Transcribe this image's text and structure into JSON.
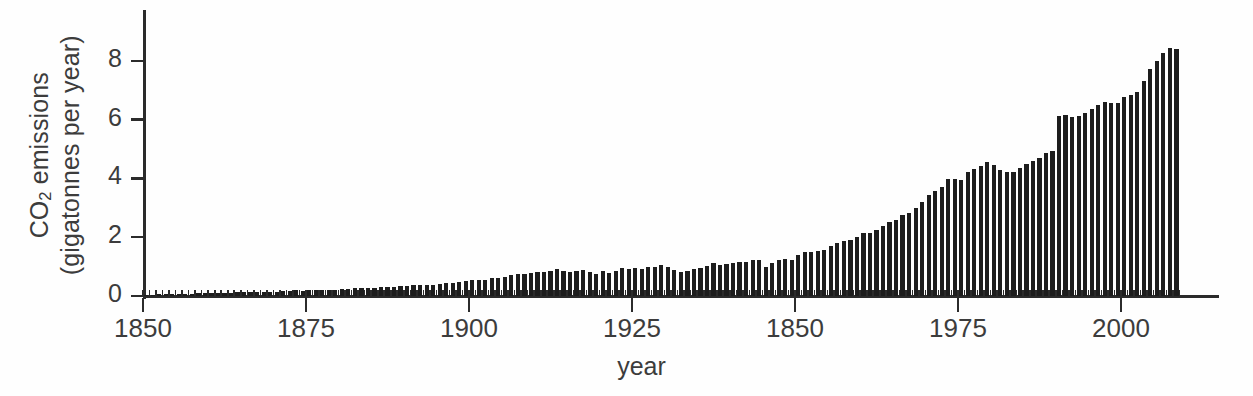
{
  "figure": {
    "background_color": "#fefefe",
    "ink_color": "#1d1d1d",
    "axis_color": "#2b2b2b",
    "text_color": "#3c3c3c"
  },
  "axes": {
    "y_title_line1_pre": "CO",
    "y_title_line1_sub": "2",
    "y_title_line1_post": " emissions",
    "y_title_line2": "(gigatonnes per year)",
    "x_title": "year",
    "y_ticks": [
      "0",
      "2",
      "4",
      "6",
      "8"
    ],
    "x_ticks": [
      "1850",
      "1875",
      "1900",
      "1925",
      "1850",
      "1975",
      "2000"
    ]
  },
  "chart_data": {
    "type": "bar",
    "title": "",
    "xlabel": "year",
    "ylabel": "CO2 emissions (gigatonnes per year)",
    "xlim": [
      1850,
      2008
    ],
    "ylim": [
      0,
      8.6
    ],
    "ytick_values": [
      0,
      2,
      4,
      6,
      8
    ],
    "xtick_values": [
      1850,
      1875,
      1900,
      1925,
      1950,
      1975,
      2000
    ],
    "xtick_labels": [
      "1850",
      "1875",
      "1900",
      "1925",
      "1850",
      "1975",
      "2000"
    ],
    "xtick_label_note": "Fifth tick is printed as 1850 in the original figure; positionally it is 1950.",
    "minor_tick_interval": 1,
    "grid": false,
    "legend": null,
    "units": "gigatonnes CO2 per year",
    "x": [
      1850,
      1851,
      1852,
      1853,
      1854,
      1855,
      1856,
      1857,
      1858,
      1859,
      1860,
      1861,
      1862,
      1863,
      1864,
      1865,
      1866,
      1867,
      1868,
      1869,
      1870,
      1871,
      1872,
      1873,
      1874,
      1875,
      1876,
      1877,
      1878,
      1879,
      1880,
      1881,
      1882,
      1883,
      1884,
      1885,
      1886,
      1887,
      1888,
      1889,
      1890,
      1891,
      1892,
      1893,
      1894,
      1895,
      1896,
      1897,
      1898,
      1899,
      1900,
      1901,
      1902,
      1903,
      1904,
      1905,
      1906,
      1907,
      1908,
      1909,
      1910,
      1911,
      1912,
      1913,
      1914,
      1915,
      1916,
      1917,
      1918,
      1919,
      1920,
      1921,
      1922,
      1923,
      1924,
      1925,
      1926,
      1927,
      1928,
      1929,
      1930,
      1931,
      1932,
      1933,
      1934,
      1935,
      1936,
      1937,
      1938,
      1939,
      1940,
      1941,
      1942,
      1943,
      1944,
      1945,
      1946,
      1947,
      1948,
      1949,
      1950,
      1951,
      1952,
      1953,
      1954,
      1955,
      1956,
      1957,
      1958,
      1959,
      1960,
      1961,
      1962,
      1963,
      1964,
      1965,
      1966,
      1967,
      1968,
      1969,
      1970,
      1971,
      1972,
      1973,
      1974,
      1975,
      1976,
      1977,
      1978,
      1979,
      1980,
      1981,
      1982,
      1983,
      1984,
      1985,
      1986,
      1987,
      1988,
      1989,
      1990,
      1991,
      1992,
      1993,
      1994,
      1995,
      1996,
      1997,
      1998,
      1999,
      2000,
      2001,
      2002,
      2003,
      2004,
      2005,
      2006,
      2007,
      2008
    ],
    "values": [
      0.05,
      0.05,
      0.06,
      0.06,
      0.07,
      0.08,
      0.08,
      0.08,
      0.09,
      0.09,
      0.1,
      0.1,
      0.1,
      0.11,
      0.12,
      0.12,
      0.13,
      0.13,
      0.14,
      0.15,
      0.15,
      0.17,
      0.18,
      0.19,
      0.18,
      0.19,
      0.2,
      0.2,
      0.2,
      0.22,
      0.24,
      0.25,
      0.26,
      0.28,
      0.28,
      0.28,
      0.29,
      0.3,
      0.32,
      0.33,
      0.35,
      0.36,
      0.37,
      0.37,
      0.39,
      0.42,
      0.43,
      0.45,
      0.48,
      0.52,
      0.53,
      0.55,
      0.55,
      0.6,
      0.6,
      0.64,
      0.7,
      0.76,
      0.74,
      0.77,
      0.8,
      0.82,
      0.86,
      0.91,
      0.84,
      0.81,
      0.86,
      0.89,
      0.83,
      0.74,
      0.85,
      0.78,
      0.84,
      0.94,
      0.92,
      0.94,
      0.92,
      1.0,
      1.0,
      1.05,
      0.99,
      0.89,
      0.8,
      0.84,
      0.91,
      0.95,
      1.03,
      1.11,
      1.05,
      1.09,
      1.13,
      1.16,
      1.16,
      1.21,
      1.21,
      1.0,
      1.13,
      1.22,
      1.27,
      1.24,
      1.4,
      1.49,
      1.5,
      1.54,
      1.57,
      1.71,
      1.81,
      1.87,
      1.91,
      2.0,
      2.13,
      2.15,
      2.25,
      2.38,
      2.51,
      2.6,
      2.74,
      2.84,
      3.0,
      3.21,
      3.43,
      3.56,
      3.72,
      3.97,
      3.97,
      3.96,
      4.21,
      4.32,
      4.42,
      4.55,
      4.45,
      4.27,
      4.21,
      4.22,
      4.36,
      4.48,
      4.6,
      4.7,
      4.86,
      4.94,
      6.13,
      6.14,
      6.1,
      6.11,
      6.24,
      6.36,
      6.51,
      6.59,
      6.58,
      6.58,
      6.77,
      6.83,
      6.93,
      7.3,
      7.72,
      8.0,
      8.25,
      8.44,
      8.39
    ],
    "annotations": [
      {
        "label": "Great Depression dip",
        "x_range": [
          1930,
          1933
        ]
      },
      {
        "label": "End of WWII dip",
        "x_range": [
          1944,
          1946
        ]
      },
      {
        "label": "Oil crisis plateau",
        "x_range": [
          1979,
          1984
        ]
      },
      {
        "label": "Peak",
        "x": 2007,
        "y": 8.44
      }
    ]
  }
}
